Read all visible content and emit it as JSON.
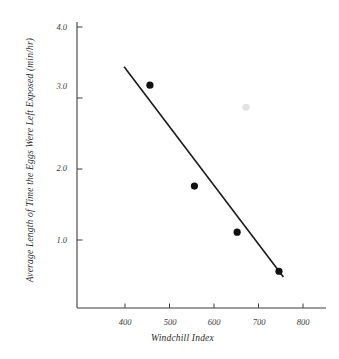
{
  "chart_data": {
    "type": "scatter",
    "title": "",
    "xlabel": "Windchill Index",
    "ylabel": "Average Length of Time the Eggs Were Left Exposed (min/hr)",
    "xlim": [
      330,
      815
    ],
    "ylim": [
      0.0,
      4.15
    ],
    "grid": false,
    "legend": false,
    "xticks": [
      400,
      500,
      600,
      700,
      800
    ],
    "xtick_labels": [
      "400",
      "500",
      "600",
      "700",
      "800"
    ],
    "yticks": [
      1.0,
      2.0,
      3.0,
      4.0
    ],
    "ytick_labels": [
      "1.0",
      "2.0",
      "3.0",
      "4.0"
    ],
    "series": [
      {
        "name": "observations",
        "marker": "filled-circle",
        "color": "#111111",
        "points": [
          {
            "x": 456,
            "y": 3.18
          },
          {
            "x": 556,
            "y": 1.76
          },
          {
            "x": 652,
            "y": 1.11
          },
          {
            "x": 746,
            "y": 0.56
          }
        ]
      },
      {
        "name": "faint-outlier",
        "marker": "filled-circle",
        "color": "#e2e2e2",
        "points": [
          {
            "x": 672,
            "y": 2.87
          }
        ]
      }
    ],
    "trendline": {
      "name": "least-squares-fit",
      "color": "#1a1a1a",
      "x_start": 398,
      "y_start": 3.44,
      "x_end": 756,
      "y_end": 0.48
    }
  },
  "axes": {
    "x_title": "Windchill Index",
    "y_title": "Average Length of Time the Eggs Were Left Exposed (min/hr)",
    "x_tick_labels": [
      "400",
      "500",
      "600",
      "700",
      "800"
    ],
    "y_tick_labels": [
      "4.0",
      "3.0",
      "2.0",
      "1.0"
    ],
    "axis_color": "#3d3d3d"
  },
  "colors": {
    "background": "#ffffff",
    "ink": "#1a1a1a",
    "marker": "#111111",
    "faint_marker": "#e2e2e2",
    "axis": "#3d3d3d"
  }
}
